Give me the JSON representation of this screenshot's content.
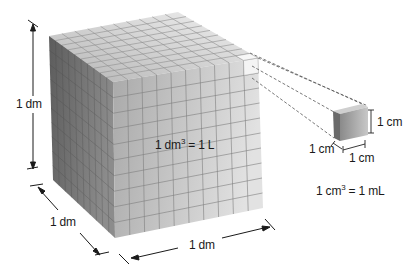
{
  "diagram": {
    "large_cube": {
      "label_volume_base": "1 dm",
      "label_volume_exp": "3",
      "label_volume_rest": " = 1 L",
      "height_label": "1 dm",
      "depth_label": "1 dm",
      "width_label": "1 dm",
      "grid_divisions": 10
    },
    "small_cube": {
      "height_label": "1 cm",
      "depth_label": "1 cm",
      "width_label": "1 cm",
      "equation_base": "1 cm",
      "equation_exp": "3",
      "equation_rest": " = 1 mL"
    },
    "colors": {
      "top_face": "#d4d4d4",
      "left_face": "#6e6e6e",
      "front_face": "#b9b9b9",
      "grid_line": "#8a8a8a",
      "dashed_line": "#555555",
      "text": "#1a1a1a"
    }
  }
}
